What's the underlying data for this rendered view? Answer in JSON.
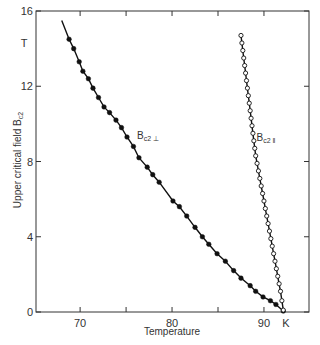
{
  "chart_data": {
    "type": "scatter",
    "title": "",
    "xlabel": "Temperature",
    "xunit": "K",
    "ylabel": "Upper critical field B",
    "ylabel_sub": "c2",
    "yunit": "T",
    "xlim": [
      65.2,
      94.9
    ],
    "ylim": [
      0,
      16
    ],
    "xticks": [
      70,
      75,
      80,
      85,
      90
    ],
    "xtick_labels": [
      "70",
      "",
      "80",
      "",
      "90"
    ],
    "yticks": [
      0,
      4,
      8,
      12,
      16
    ],
    "ytick_labels": [
      "0",
      "4",
      "8",
      "12",
      "16"
    ],
    "grid": false,
    "legend": "inline annotations",
    "series": [
      {
        "name": "Bc2 ⊥",
        "label_main": "B",
        "label_sub": "c2 ⊥",
        "label_pos": [
          76.2,
          9.2
        ],
        "marker": "filled-circle",
        "color": "#111111",
        "line_start": [
          68.0,
          15.5
        ],
        "x": [
          68.8,
          69.3,
          69.9,
          70.3,
          70.9,
          71.4,
          72.0,
          72.6,
          73.2,
          73.9,
          74.5,
          75.1,
          75.8,
          76.4,
          77.3,
          77.9,
          78.6,
          80.1,
          80.8,
          81.6,
          82.5,
          83.3,
          84.0,
          84.9,
          85.8,
          86.7,
          87.5,
          88.5,
          89.1,
          89.9,
          90.7,
          91.3,
          92.1
        ],
        "y": [
          14.5,
          14.0,
          13.3,
          12.8,
          12.4,
          11.9,
          11.4,
          10.9,
          10.6,
          10.2,
          9.8,
          9.3,
          8.8,
          8.2,
          7.7,
          7.3,
          6.9,
          5.9,
          5.6,
          5.1,
          4.5,
          4.0,
          3.6,
          3.1,
          2.7,
          2.2,
          1.8,
          1.4,
          1.1,
          0.8,
          0.6,
          0.4,
          0.05
        ]
      },
      {
        "name": "Bc2 ‖",
        "label_main": "B",
        "label_sub": "c2 ‖",
        "label_pos": [
          89.2,
          9.1
        ],
        "marker": "open-circle",
        "color": "#111111",
        "x": [
          87.5,
          87.6,
          87.7,
          87.8,
          87.9,
          88.0,
          88.1,
          88.2,
          88.3,
          88.4,
          88.5,
          88.6,
          88.7,
          88.8,
          88.9,
          89.0,
          89.1,
          89.25,
          89.4,
          89.55,
          89.7,
          89.85,
          90.0,
          90.15,
          90.3,
          90.45,
          90.6,
          90.75,
          90.9,
          91.05,
          91.2,
          91.35,
          91.5,
          91.65,
          91.8,
          91.95,
          92.1
        ],
        "y": [
          14.7,
          14.3,
          13.9,
          13.5,
          13.1,
          12.7,
          12.3,
          11.9,
          11.5,
          11.1,
          10.7,
          10.3,
          9.9,
          9.5,
          9.1,
          8.7,
          8.3,
          7.9,
          7.5,
          7.1,
          6.7,
          6.3,
          5.9,
          5.5,
          5.1,
          4.7,
          4.3,
          3.9,
          3.5,
          3.1,
          2.7,
          2.3,
          1.9,
          1.5,
          1.1,
          0.6,
          0.1
        ]
      }
    ]
  },
  "plot_area": {
    "left": 36,
    "top": 11,
    "right": 309,
    "bottom": 312
  }
}
